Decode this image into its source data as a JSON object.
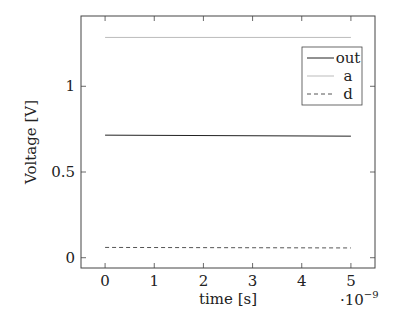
{
  "chart_data": {
    "type": "line",
    "title": "",
    "xlabel": "time [s]",
    "ylabel": "Voltage [V]",
    "x_multiplier_label": "·10⁻⁹",
    "x_scale": 1e-09,
    "xlim": [
      -0.49,
      5.49
    ],
    "ylim": [
      -0.06,
      1.41
    ],
    "xticks": [
      0,
      1,
      2,
      3,
      4,
      5
    ],
    "yticks": [
      0,
      0.5,
      1
    ],
    "xtick_labels": [
      "0",
      "1",
      "2",
      "3",
      "4",
      "5"
    ],
    "ytick_labels": [
      "0",
      "0.5",
      "1"
    ],
    "grid": false,
    "legend_position": "upper right",
    "series": [
      {
        "name": "out",
        "style": "solid",
        "color": "#222222",
        "x": [
          0,
          5
        ],
        "values": [
          0.715,
          0.709
        ]
      },
      {
        "name": "a",
        "style": "solid",
        "color": "#aaaaaa",
        "x": [
          0,
          5
        ],
        "values": [
          1.285,
          1.285
        ]
      },
      {
        "name": "d",
        "style": "dashed",
        "color": "#555555",
        "x": [
          0,
          5
        ],
        "values": [
          0.06,
          0.057
        ]
      }
    ]
  },
  "legend": {
    "items": [
      {
        "label": "out"
      },
      {
        "label": "a"
      },
      {
        "label": "d"
      }
    ]
  }
}
